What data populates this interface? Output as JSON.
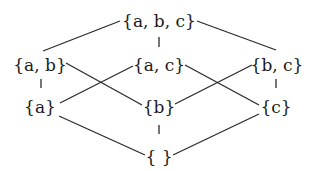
{
  "diagram": {
    "type": "hasse-diagram",
    "nodes": [
      {
        "id": "abc",
        "label": "{a, b, c}",
        "x": 159,
        "y": 21
      },
      {
        "id": "ab",
        "label": "{a, b}",
        "x": 40,
        "y": 65
      },
      {
        "id": "ac",
        "label": "{a, c}",
        "x": 159,
        "y": 65
      },
      {
        "id": "bc",
        "label": "{b, c}",
        "x": 277,
        "y": 65
      },
      {
        "id": "a",
        "label": "{a}",
        "x": 40,
        "y": 107
      },
      {
        "id": "b",
        "label": "{b}",
        "x": 159,
        "y": 107
      },
      {
        "id": "c",
        "label": "{c}",
        "x": 276,
        "y": 107
      },
      {
        "id": "empty",
        "label": "{ }",
        "x": 159,
        "y": 157
      }
    ],
    "edges": [
      {
        "from": "abc",
        "to": "ab",
        "x1": 120,
        "y1": 21,
        "x2": 43,
        "y2": 51
      },
      {
        "from": "abc",
        "to": "ac",
        "x1": 159,
        "y1": 37,
        "x2": 159,
        "y2": 47
      },
      {
        "from": "abc",
        "to": "bc",
        "x1": 197,
        "y1": 21,
        "x2": 276,
        "y2": 50
      },
      {
        "from": "ab",
        "to": "a",
        "x1": 41,
        "y1": 79,
        "x2": 41,
        "y2": 88
      },
      {
        "from": "ab",
        "to": "b",
        "x1": 66,
        "y1": 63,
        "x2": 142,
        "y2": 105
      },
      {
        "from": "ac",
        "to": "a",
        "x1": 133,
        "y1": 66,
        "x2": 60,
        "y2": 103
      },
      {
        "from": "ac",
        "to": "c",
        "x1": 185,
        "y1": 65,
        "x2": 259,
        "y2": 105
      },
      {
        "from": "bc",
        "to": "b",
        "x1": 252,
        "y1": 65,
        "x2": 175,
        "y2": 104
      },
      {
        "from": "bc",
        "to": "c",
        "x1": 276,
        "y1": 79,
        "x2": 276,
        "y2": 88
      },
      {
        "from": "a",
        "to": "empty",
        "x1": 59,
        "y1": 116,
        "x2": 145,
        "y2": 155
      },
      {
        "from": "b",
        "to": "empty",
        "x1": 159,
        "y1": 125,
        "x2": 159,
        "y2": 134
      },
      {
        "from": "c",
        "to": "empty",
        "x1": 259,
        "y1": 114,
        "x2": 173,
        "y2": 155
      }
    ],
    "colors": {
      "line": "#2a2a2a",
      "text": "#1a1a1a",
      "background": "#ffffff"
    }
  }
}
